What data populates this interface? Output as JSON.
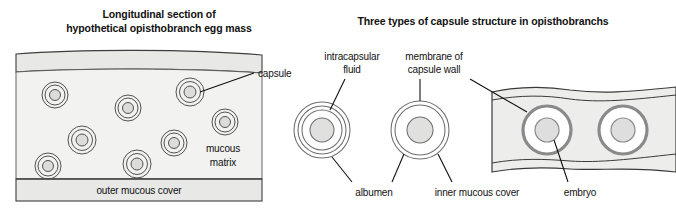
{
  "figure": {
    "background_color": "#ffffff",
    "panels": [
      {
        "id": "left-panel",
        "title_line1": "Longitudinal section of",
        "title_line2": "hypothetical opisthobranch egg mass",
        "labels": {
          "capsule": "capsule",
          "mucous_matrix_line1": "mucous",
          "mucous_matrix_line2": "matrix",
          "outer_mucous_cover": "outer mucous cover"
        },
        "egg_count": 8,
        "eggs": [
          {
            "cx": 55,
            "cy": 95,
            "r": 13
          },
          {
            "cx": 128,
            "cy": 108,
            "r": 13
          },
          {
            "cx": 190,
            "cy": 92,
            "r": 14
          },
          {
            "cx": 225,
            "cy": 122,
            "r": 13
          },
          {
            "cx": 82,
            "cy": 140,
            "r": 14
          },
          {
            "cx": 174,
            "cy": 143,
            "r": 13
          },
          {
            "cx": 48,
            "cy": 166,
            "r": 13
          },
          {
            "cx": 137,
            "cy": 164,
            "r": 14
          }
        ],
        "colors": {
          "matrix_fill": "#f2f2f0",
          "band_fill": "#e8e8e6",
          "egg_core": "#dcdcda",
          "outline": "#4a4a4a"
        }
      },
      {
        "id": "right-panel",
        "title": "Three types of capsule structure in opisthobranchs",
        "labels": {
          "intracapsular_fluid_line1": "intracapsular",
          "intracapsular_fluid_line2": "fluid",
          "membrane_line1": "membrane of",
          "membrane_line2": "capsule wall",
          "albumen": "albumen",
          "inner_mucous_cover": "inner mucous cover",
          "embryo": "embryo"
        },
        "structures": [
          {
            "type": "concentric-rings",
            "cx": 322,
            "cy": 130,
            "outer_r": 28,
            "ring_count": 3,
            "core_r": 12
          },
          {
            "type": "double-ring",
            "cx": 420,
            "cy": 130,
            "outer_r": 29,
            "ring_count": 2,
            "core_r": 13
          },
          {
            "type": "capsule-chain",
            "capsule_count": 2,
            "centers": [
              547,
              623
            ],
            "cy": 130,
            "ring_r": 24,
            "core_r": 12
          }
        ],
        "colors": {
          "capsule_outline": "#6e6e6e",
          "chain_outline": "#8a8a8a",
          "capsule_core": "#e0e0de",
          "chain_band": "#ededeb"
        }
      }
    ]
  }
}
